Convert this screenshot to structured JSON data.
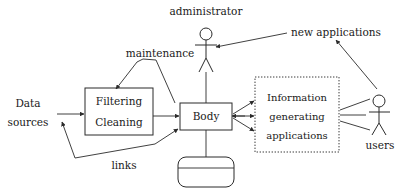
{
  "diagram": {
    "background_color": "#ffffff",
    "line_color": "#2b2b2b",
    "text_color": "#1a1a1a",
    "nodes": {
      "data_sources": {
        "line1": "Data",
        "line2": "sources"
      },
      "filtering_cleaning": {
        "line1": "Filtering",
        "line2": "Cleaning"
      },
      "body": {
        "label": "Body"
      },
      "database": {
        "label": ""
      },
      "info_apps": {
        "line1": "Information",
        "line2": "generating",
        "line3": "applications"
      },
      "administrator": {
        "label": "administrator"
      },
      "users": {
        "label": "users"
      },
      "new_applications": {
        "label": "new applications"
      }
    },
    "edge_labels": {
      "maintenance": "maintenance",
      "links": "links"
    }
  }
}
